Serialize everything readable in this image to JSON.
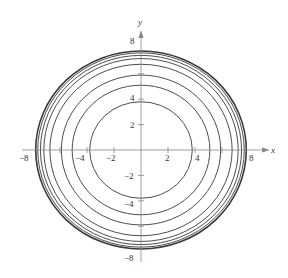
{
  "chart_data": {
    "type": "line",
    "title": "",
    "xlabel": "x",
    "ylabel": "y",
    "xlim": [
      -8,
      8
    ],
    "ylim": [
      -8,
      8
    ],
    "grid": false,
    "legend": null,
    "x_ticks": [
      -8,
      -6,
      -4,
      -2,
      2,
      4,
      6,
      8
    ],
    "y_ticks": [
      -8,
      -6,
      -4,
      -2,
      2,
      4,
      6,
      8
    ],
    "x_tick_labels": [
      {
        "value": -8,
        "label": "−8"
      },
      {
        "value": -4,
        "label": "−4"
      },
      {
        "value": -2,
        "label": "−2"
      },
      {
        "value": 2,
        "label": "2"
      },
      {
        "value": 4,
        "label": "4"
      },
      {
        "value": 8,
        "label": "8"
      }
    ],
    "y_tick_labels": [
      {
        "value": 8,
        "label": "8"
      },
      {
        "value": 4,
        "label": "4"
      },
      {
        "value": 2,
        "label": "2"
      },
      {
        "value": -2,
        "label": "−2"
      },
      {
        "value": -4,
        "label": "−4"
      },
      {
        "value": -8,
        "label": "−8"
      }
    ],
    "series": [
      {
        "name": "circle-1",
        "shape": "circle",
        "center": [
          0,
          0
        ],
        "radius": 3.8
      },
      {
        "name": "circle-2",
        "shape": "circle",
        "center": [
          0,
          0
        ],
        "radius": 5.1
      },
      {
        "name": "circle-3",
        "shape": "circle",
        "center": [
          0,
          0
        ],
        "radius": 5.9
      },
      {
        "name": "circle-4",
        "shape": "circle",
        "center": [
          0,
          0
        ],
        "radius": 6.75
      },
      {
        "name": "circle-5",
        "shape": "circle",
        "center": [
          0,
          0
        ],
        "radius": 7.2
      },
      {
        "name": "circle-6",
        "shape": "circle",
        "center": [
          0,
          0
        ],
        "radius": 7.45
      },
      {
        "name": "circle-7",
        "shape": "circle",
        "center": [
          0,
          0
        ],
        "radius": 7.65
      },
      {
        "name": "circle-8",
        "shape": "circle",
        "center": [
          0,
          0
        ],
        "radius": 7.8
      }
    ]
  },
  "style": {
    "curve_color": "#3a3a3a",
    "axis_color": "#888888",
    "text_color": "#333333",
    "background": "#ffffff"
  }
}
